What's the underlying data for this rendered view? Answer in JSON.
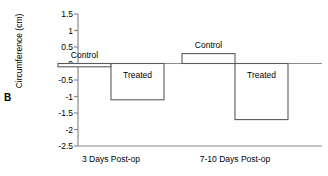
{
  "panel": {
    "label": "B"
  },
  "chart_data": {
    "type": "bar",
    "title": "",
    "subtitle": "",
    "xlabel": "",
    "ylabel": "Circumference (cm)",
    "categories": [
      "3 Days Post-op",
      "7-10 Days Post-op"
    ],
    "series": [
      {
        "name": "Control",
        "values": [
          -0.1,
          0.3
        ]
      },
      {
        "name": "Treated",
        "values": [
          -1.1,
          -1.7
        ]
      }
    ],
    "ylim": [
      -2.5,
      1.5
    ],
    "ytick_values": [
      1.5,
      1,
      0.5,
      0,
      -0.5,
      -1,
      -1.5,
      -2,
      -2.5
    ],
    "ytick_labels": [
      "1.5",
      "1",
      "0.5",
      "0",
      "-0.5",
      "-1",
      "-1.5",
      "-2",
      "-2.5"
    ],
    "grid": false,
    "legend": "none",
    "bar_style": "outlined-white-fill",
    "zero_line": true,
    "annotations": [
      {
        "text": "Control",
        "group": "3 Days Post-op"
      },
      {
        "text": "Treated",
        "group": "3 Days Post-op"
      },
      {
        "text": "Control",
        "group": "7-10 Days Post-op"
      },
      {
        "text": "Treated",
        "group": "7-10 Days Post-op"
      }
    ]
  },
  "axis_colors": {
    "spine": "#8a8a8a",
    "bar_stroke": "#5a5a5a",
    "bar_fill": "#ffffff",
    "text": "#000000"
  }
}
